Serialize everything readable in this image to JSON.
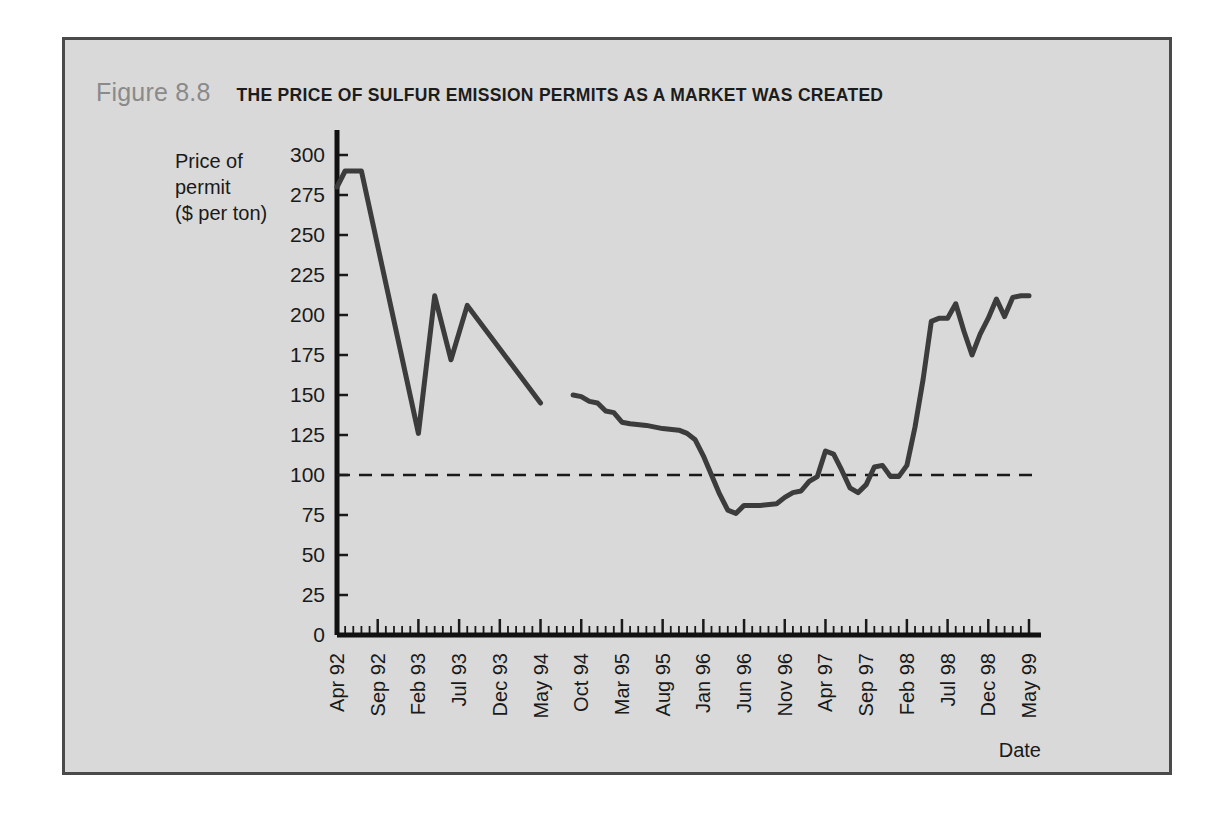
{
  "figure": {
    "number": "Figure 8.8",
    "title": "THE PRICE OF SULFUR EMISSION PERMITS AS A MARKET WAS CREATED",
    "number_color": "#8a8a8a",
    "title_color": "#1c1c1c",
    "panel_background": "#d9d9d9",
    "border_color": "#4a4a4a"
  },
  "chart_data": {
    "type": "line",
    "title": "THE PRICE OF SULFUR EMISSION PERMITS AS A MARKET WAS CREATED",
    "xlabel": "Date",
    "ylabel": "Price of permit ($ per ton)",
    "ylabel_lines": [
      "Price of",
      "permit",
      "($ per ton)"
    ],
    "ylim": [
      0,
      300
    ],
    "yticks": [
      0,
      25,
      50,
      75,
      100,
      125,
      150,
      175,
      200,
      225,
      250,
      275,
      300
    ],
    "xtick_labels": [
      "Apr 92",
      "Sep 92",
      "Feb 93",
      "Jul 93",
      "Dec 93",
      "May 94",
      "Oct 94",
      "Mar 95",
      "Aug 95",
      "Jan 96",
      "Jun 96",
      "Nov 96",
      "Apr 97",
      "Sep 97",
      "Feb 98",
      "Jul 98",
      "Dec 98",
      "May 99"
    ],
    "xtick_interval_months": 5,
    "x_start_label": "Apr 92",
    "x_end_label": "May 99",
    "x_total_months": 86,
    "minor_tick_interval_months": 1,
    "grid": false,
    "legend": null,
    "line_color": "#3c3c3c",
    "line_width": 5,
    "reference_line": {
      "value": 100,
      "style": "dashed",
      "color": "#1a1a1a",
      "label": ""
    },
    "series": [
      {
        "name": "Price of permit ($ per ton) — segment 1",
        "note": "Apr 1992 through May 1994 (auction period before continuous market)",
        "points": [
          {
            "x": 0,
            "label": "Apr 92",
            "y": 280
          },
          {
            "x": 1,
            "label": "May 92",
            "y": 290
          },
          {
            "x": 2,
            "label": "Jun 92",
            "y": 290
          },
          {
            "x": 3,
            "label": "Jul 92",
            "y": 290
          },
          {
            "x": 10,
            "label": "Feb 93",
            "y": 126
          },
          {
            "x": 12,
            "label": "Apr 93",
            "y": 212
          },
          {
            "x": 14,
            "label": "Jun 93",
            "y": 172
          },
          {
            "x": 16,
            "label": "Aug 93",
            "y": 206
          },
          {
            "x": 25,
            "label": "May 94",
            "y": 145
          }
        ]
      },
      {
        "name": "Price of permit ($ per ton) — segment 2",
        "note": "Sep 1994 through May 1999 (continuous market)",
        "points": [
          {
            "x": 29,
            "label": "Sep 94",
            "y": 150
          },
          {
            "x": 30,
            "label": "Oct 94",
            "y": 149
          },
          {
            "x": 31,
            "label": "Nov 94",
            "y": 146
          },
          {
            "x": 32,
            "label": "Dec 94",
            "y": 145
          },
          {
            "x": 33,
            "label": "Jan 95",
            "y": 140
          },
          {
            "x": 34,
            "label": "Feb 95",
            "y": 139
          },
          {
            "x": 35,
            "label": "Mar 95",
            "y": 133
          },
          {
            "x": 36,
            "label": "Apr 95",
            "y": 132
          },
          {
            "x": 38,
            "label": "Jun 95",
            "y": 131
          },
          {
            "x": 40,
            "label": "Aug 95",
            "y": 129
          },
          {
            "x": 42,
            "label": "Oct 95",
            "y": 128
          },
          {
            "x": 43,
            "label": "Nov 95",
            "y": 126
          },
          {
            "x": 44,
            "label": "Dec 95",
            "y": 122
          },
          {
            "x": 45,
            "label": "Jan 96",
            "y": 112
          },
          {
            "x": 46,
            "label": "Feb 96",
            "y": 100
          },
          {
            "x": 47,
            "label": "Mar 96",
            "y": 88
          },
          {
            "x": 48,
            "label": "Apr 96",
            "y": 78
          },
          {
            "x": 49,
            "label": "May 96",
            "y": 76
          },
          {
            "x": 50,
            "label": "Jun 96",
            "y": 81
          },
          {
            "x": 52,
            "label": "Aug 96",
            "y": 81
          },
          {
            "x": 54,
            "label": "Oct 96",
            "y": 82
          },
          {
            "x": 55,
            "label": "Nov 96",
            "y": 86
          },
          {
            "x": 56,
            "label": "Dec 96",
            "y": 89
          },
          {
            "x": 57,
            "label": "Jan 97",
            "y": 90
          },
          {
            "x": 58,
            "label": "Feb 97",
            "y": 96
          },
          {
            "x": 59,
            "label": "Mar 97",
            "y": 99
          },
          {
            "x": 60,
            "label": "Apr 97",
            "y": 115
          },
          {
            "x": 61,
            "label": "May 97",
            "y": 113
          },
          {
            "x": 62,
            "label": "Jun 97",
            "y": 103
          },
          {
            "x": 63,
            "label": "Jul 97",
            "y": 92
          },
          {
            "x": 64,
            "label": "Aug 97",
            "y": 89
          },
          {
            "x": 65,
            "label": "Sep 97",
            "y": 94
          },
          {
            "x": 66,
            "label": "Oct 97",
            "y": 105
          },
          {
            "x": 67,
            "label": "Nov 97",
            "y": 106
          },
          {
            "x": 68,
            "label": "Dec 97",
            "y": 99
          },
          {
            "x": 69,
            "label": "Jan 98",
            "y": 99
          },
          {
            "x": 70,
            "label": "Feb 98",
            "y": 106
          },
          {
            "x": 71,
            "label": "Mar 98",
            "y": 130
          },
          {
            "x": 72,
            "label": "Apr 98",
            "y": 160
          },
          {
            "x": 73,
            "label": "May 98",
            "y": 196
          },
          {
            "x": 74,
            "label": "Jun 98",
            "y": 198
          },
          {
            "x": 75,
            "label": "Jul 98",
            "y": 198
          },
          {
            "x": 76,
            "label": "Aug 98",
            "y": 207
          },
          {
            "x": 77,
            "label": "Sep 98",
            "y": 190
          },
          {
            "x": 78,
            "label": "Oct 98",
            "y": 175
          },
          {
            "x": 79,
            "label": "Nov 98",
            "y": 188
          },
          {
            "x": 80,
            "label": "Dec 98",
            "y": 198
          },
          {
            "x": 81,
            "label": "Jan 99",
            "y": 210
          },
          {
            "x": 82,
            "label": "Feb 99",
            "y": 199
          },
          {
            "x": 83,
            "label": "Mar 99",
            "y": 211
          },
          {
            "x": 84,
            "label": "Apr 99",
            "y": 212
          },
          {
            "x": 85,
            "label": "May 99",
            "y": 212
          }
        ]
      }
    ]
  }
}
